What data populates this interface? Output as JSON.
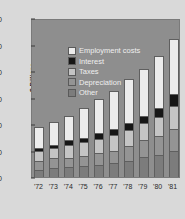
{
  "chart_data": {
    "type": "bar",
    "subtype": "stacked-bar",
    "title": "",
    "xlabel": "",
    "ylabel": "$ Billions",
    "ylim": [
      0,
      60
    ],
    "yticks": [
      0,
      10,
      20,
      30,
      40,
      50,
      60
    ],
    "ytick_labels": [
      "0",
      "10",
      "20",
      "30",
      "40",
      "50",
      "60"
    ],
    "grid": false,
    "legend_position": "upper-left",
    "categories": [
      "'72",
      "'73",
      "'74",
      "'75",
      "'76",
      "'77",
      "'78",
      "'79",
      "'80",
      "'81"
    ],
    "series": [
      {
        "name": "Other",
        "color": "#7c7c7c",
        "values": [
          2.6,
          3.4,
          3.6,
          4.1,
          4.7,
          5.4,
          6.2,
          7.6,
          8.2,
          10.0
        ]
      },
      {
        "name": "Depreciation",
        "color": "#949494",
        "values": [
          3.5,
          3.6,
          3.6,
          4.0,
          4.3,
          4.6,
          5.6,
          6.2,
          7.4,
          8.2
        ]
      },
      {
        "name": "Taxes",
        "color": "#c4c4c4",
        "values": [
          3.6,
          3.8,
          5.0,
          5.1,
          5.5,
          6.0,
          6.1,
          6.5,
          7.2,
          8.6
        ]
      },
      {
        "name": "Interest",
        "color": "#161616",
        "values": [
          1.2,
          1.3,
          1.6,
          1.7,
          2.0,
          2.2,
          2.4,
          2.6,
          3.1,
          4.4
        ]
      },
      {
        "name": "Employment costs",
        "color": "#ececec",
        "values": [
          8.0,
          8.8,
          9.3,
          11.3,
          12.9,
          14.2,
          16.6,
          17.7,
          19.8,
          20.9
        ]
      }
    ],
    "totals": [
      18.9,
      20.9,
      23.1,
      26.2,
      29.4,
      32.4,
      36.9,
      40.6,
      45.7,
      52.1
    ],
    "legend_order": [
      "Employment costs",
      "Interest",
      "Taxes",
      "Depreciation",
      "Other"
    ],
    "colors": {
      "employment_costs": "#ececec",
      "interest": "#161616",
      "taxes": "#c4c4c4",
      "depreciation": "#949494",
      "other": "#7c7c7c",
      "plot_background": "#8e8e8e",
      "figure_background": "#d9d9d9"
    }
  }
}
